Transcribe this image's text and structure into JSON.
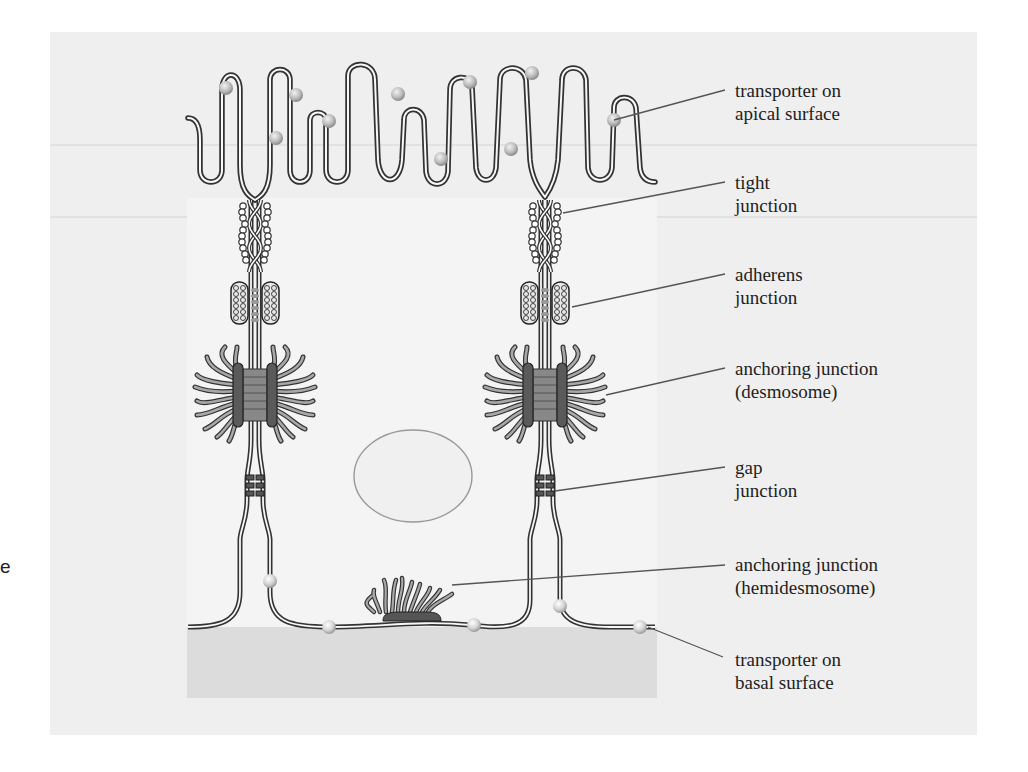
{
  "figure": {
    "type": "epithelial cell junctions diagram",
    "edge_fragment": "e"
  },
  "labels": [
    {
      "id": "transporter-apical",
      "line1": "transporter on",
      "line2": "apical surface",
      "top": 93,
      "anchor": [
        614,
        120
      ]
    },
    {
      "id": "tight-junction",
      "line1": "tight",
      "line2": "junction",
      "top": 172,
      "anchor": [
        563,
        213
      ]
    },
    {
      "id": "adherens-junction",
      "line1": "adherens",
      "line2": "junction",
      "top": 264,
      "anchor": [
        572,
        307
      ]
    },
    {
      "id": "desmosome",
      "line1": "anchoring junction",
      "line2": "(desmosome)",
      "top": 359,
      "anchor": [
        606,
        395
      ]
    },
    {
      "id": "gap-junction",
      "line1": "gap",
      "line2": "junction",
      "top": 456,
      "anchor": [
        555,
        491
      ]
    },
    {
      "id": "hemidesmosome",
      "line1": "anchoring junction",
      "line2": "(hemidesmosome)",
      "top": 553,
      "anchor": [
        452,
        585
      ]
    },
    {
      "id": "transporter-basal",
      "line1": "transporter on",
      "line2": "basal surface",
      "top": 647,
      "anchor": [
        648,
        627
      ]
    }
  ],
  "colors": {
    "panel": "#efefef",
    "cell": "#f4f4f4",
    "basal": "#dcdcdc",
    "membrane": "#333333",
    "transporter": "#b8b8b8",
    "plaque": "#555555",
    "leader": "#555555"
  }
}
